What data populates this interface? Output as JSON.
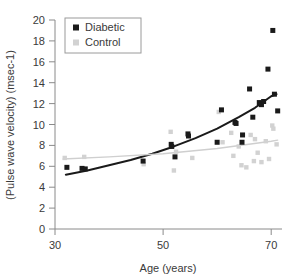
{
  "chart_data": {
    "type": "scatter",
    "title": "",
    "xlabel": "Age (years)",
    "ylabel": "(Pulse wave velocity) (msec-1)",
    "xlim": [
      30,
      72
    ],
    "ylim": [
      0,
      20
    ],
    "xticks": [
      30,
      50,
      70
    ],
    "xtick_labels": [
      "30",
      "50",
      "70"
    ],
    "yticks": [
      0,
      2,
      4,
      6,
      8,
      10,
      12,
      14,
      16,
      18,
      20
    ],
    "ytick_labels": [
      "0",
      "2",
      "4",
      "6",
      "8",
      "10",
      "12",
      "14",
      "16",
      "18",
      "20"
    ],
    "grid": false,
    "legend_position": "top-left",
    "series": [
      {
        "name": "Diabetic",
        "marker": "square",
        "color": "#1a1a1a",
        "points": [
          [
            32.2,
            5.9
          ],
          [
            35.0,
            5.8
          ],
          [
            35.6,
            5.75
          ],
          [
            46.3,
            6.5
          ],
          [
            51.5,
            8.1
          ],
          [
            51.6,
            7.9
          ],
          [
            52.2,
            6.9
          ],
          [
            54.6,
            9.1
          ],
          [
            54.7,
            8.9
          ],
          [
            60.0,
            8.3
          ],
          [
            60.8,
            11.4
          ],
          [
            63.3,
            10.2
          ],
          [
            63.5,
            10.1
          ],
          [
            64.6,
            8.3
          ],
          [
            64.7,
            9.0
          ],
          [
            66.0,
            13.4
          ],
          [
            66.6,
            10.7
          ],
          [
            67.8,
            12.1
          ],
          [
            68.0,
            12.0
          ],
          [
            68.2,
            11.9
          ],
          [
            68.6,
            12.2
          ],
          [
            69.4,
            15.3
          ],
          [
            70.3,
            19.0
          ],
          [
            70.6,
            12.9
          ],
          [
            71.2,
            11.3
          ]
        ]
      },
      {
        "name": "Control",
        "marker": "square",
        "color": "#d2d2d2",
        "points": [
          [
            31.8,
            6.8
          ],
          [
            35.4,
            6.9
          ],
          [
            46.4,
            6.2
          ],
          [
            51.4,
            9.3
          ],
          [
            52.0,
            5.6
          ],
          [
            52.4,
            7.4
          ],
          [
            55.4,
            6.8
          ],
          [
            60.3,
            11.2
          ],
          [
            61.0,
            8.3
          ],
          [
            62.6,
            9.2
          ],
          [
            63.0,
            7.0
          ],
          [
            64.0,
            7.9
          ],
          [
            64.5,
            6.1
          ],
          [
            65.4,
            5.9
          ],
          [
            66.2,
            9.0
          ],
          [
            66.8,
            6.5
          ],
          [
            67.0,
            8.6
          ],
          [
            67.5,
            7.3
          ],
          [
            68.2,
            6.4
          ],
          [
            69.0,
            8.4
          ],
          [
            69.6,
            6.7
          ],
          [
            70.2,
            9.9
          ],
          [
            70.4,
            9.6
          ],
          [
            71.0,
            8.1
          ]
        ]
      }
    ],
    "fit_lines": [
      {
        "name": "Diabetic fit",
        "color": "#1a1a1a",
        "curve": [
          [
            32.0,
            5.2
          ],
          [
            36.0,
            5.6
          ],
          [
            40.0,
            6.1
          ],
          [
            44.0,
            6.6
          ],
          [
            48.0,
            7.2
          ],
          [
            52.0,
            7.9
          ],
          [
            56.0,
            8.7
          ],
          [
            60.0,
            9.6
          ],
          [
            64.0,
            10.7
          ],
          [
            67.0,
            11.6
          ],
          [
            70.0,
            12.7
          ],
          [
            71.0,
            12.9
          ]
        ]
      },
      {
        "name": "Control fit",
        "color": "#cfcfcf",
        "curve": [
          [
            31.5,
            6.7
          ],
          [
            40.0,
            6.9
          ],
          [
            50.0,
            7.2
          ],
          [
            60.0,
            7.7
          ],
          [
            70.0,
            8.4
          ],
          [
            71.2,
            8.5
          ]
        ]
      }
    ],
    "legend": [
      {
        "label": "Diabetic",
        "color": "#1a1a1a"
      },
      {
        "label": "Control",
        "color": "#d2d2d2"
      }
    ]
  }
}
